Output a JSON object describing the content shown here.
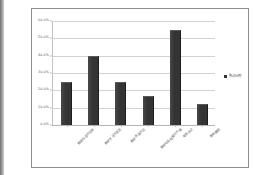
{
  "chart_data": {
    "type": "bar",
    "title": "",
    "subtitle": "",
    "xlabel": "",
    "ylabel": "",
    "ylim": [
      0,
      60
    ],
    "ytick_labels": [
      "60.0%",
      "50.0%",
      "40.0%",
      "30.0%",
      "20.0%",
      "10.0%",
      "0.0%"
    ],
    "ytick_values": [
      60,
      50,
      40,
      30,
      20,
      10,
      0
    ],
    "grid": true,
    "legend_position": "right",
    "categories": [
      "教学内容不实用",
      "教学方法不灵活",
      "教学资源不足",
      "教学与实践脱节不够",
      "考核方式",
      "其他原因"
    ],
    "series": [
      {
        "name": "所占比例",
        "values": [
          25.0,
          40.0,
          25.0,
          17.0,
          55.0,
          12.0
        ],
        "color": "#343434"
      }
    ]
  },
  "legend": {
    "label": "所占比例"
  },
  "frame": {
    "border_color": "#8d8d8d",
    "background": "#ffffff"
  }
}
